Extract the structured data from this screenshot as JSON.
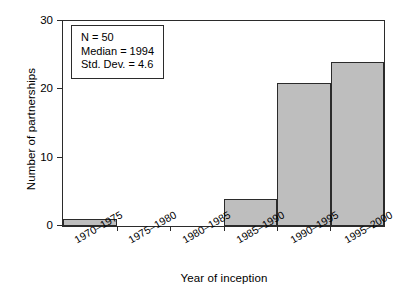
{
  "chart_data": {
    "type": "bar",
    "title": "",
    "xlabel": "Year of inception",
    "ylabel": "Number of partnerships",
    "categories": [
      "1970–1975",
      "1975–1980",
      "1980–1985",
      "1985–1990",
      "1990–1995",
      "1995–2000"
    ],
    "values": [
      1,
      0,
      0,
      4,
      21,
      24
    ],
    "ylim": [
      0,
      30
    ],
    "yticks": [
      0,
      10,
      20,
      30
    ],
    "ytick_labels": [
      "0",
      "10",
      "20",
      "30"
    ],
    "grid": false,
    "legend": null,
    "bar_color": "#bebebe",
    "bar_edge_color": "#2b2b2b",
    "annotations": {
      "stats_box": {
        "lines": [
          "N = 50",
          "Median = 1994",
          "Std. Dev. = 4.6"
        ],
        "n_label": "N = 50",
        "median_label": "Median = 1994",
        "stddev_label": "Std. Dev. = 4.6"
      }
    }
  }
}
